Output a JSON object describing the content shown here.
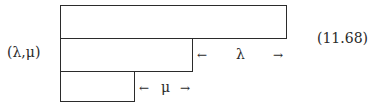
{
  "diagram": {
    "label": "(λ,μ)",
    "equation_number": "(11.68)",
    "rows": [
      {
        "name": "row-1",
        "length": "full"
      },
      {
        "name": "row-2",
        "length": "partial"
      },
      {
        "name": "row-3",
        "length": "short"
      }
    ],
    "lambda_annotation": {
      "left_arrow": "←",
      "symbol": "λ",
      "right_arrow": "→"
    },
    "mu_annotation": {
      "left_arrow": "←",
      "symbol": "μ",
      "right_arrow": "→"
    }
  }
}
